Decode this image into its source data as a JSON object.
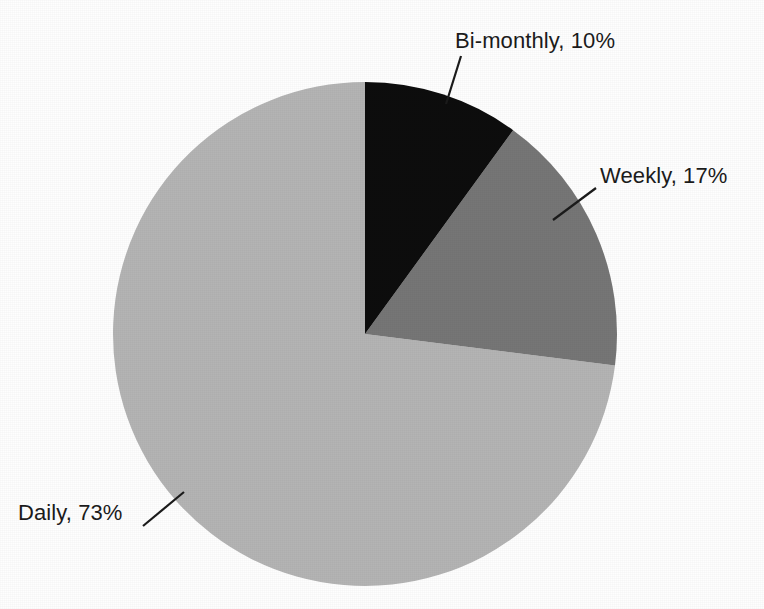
{
  "chart_data": {
    "type": "pie",
    "title": "",
    "labels": [
      "Daily",
      "Weekly",
      "Bi-monthly"
    ],
    "values": [
      73,
      17,
      10
    ],
    "value_suffix": "%",
    "data_labels": [
      "Daily, 73%",
      "Weekly, 17%",
      "Bi-monthly, 10%"
    ],
    "legend": "none",
    "label_placement": "outside-with-leader-lines",
    "start_angle_deg": 0,
    "direction": "clockwise",
    "colors": [
      "#b4b4b4",
      "#767676",
      "#0d0d0d"
    ],
    "slices": [
      {
        "name": "Bi-monthly",
        "value": 10,
        "label": "Bi-monthly, 10%",
        "color": "#0d0d0d",
        "start_angle_deg": 0,
        "end_angle_deg": 36
      },
      {
        "name": "Weekly",
        "value": 17,
        "label": "Weekly, 17%",
        "color": "#767676",
        "start_angle_deg": 36,
        "end_angle_deg": 97.2
      },
      {
        "name": "Daily",
        "value": 73,
        "label": "Daily, 73%",
        "color": "#b4b4b4",
        "start_angle_deg": 97.2,
        "end_angle_deg": 360
      }
    ],
    "geometry": {
      "center_x": 365,
      "center_y": 334,
      "radius": 252
    },
    "background_color": "#fefefe",
    "leader_line_color": "#1b1b1b"
  }
}
